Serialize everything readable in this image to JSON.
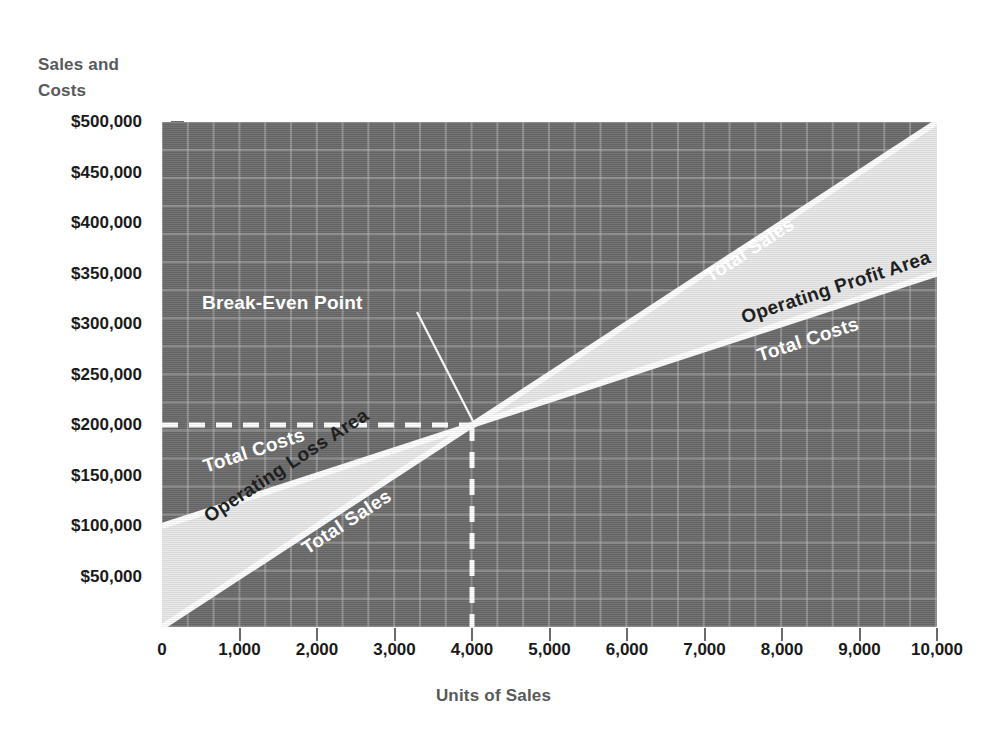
{
  "chart_data": {
    "type": "line",
    "title": "",
    "xlabel": "Units of Sales",
    "ylabel_line1": "Sales and",
    "ylabel_line2": "Costs",
    "xlim": [
      0,
      10000
    ],
    "ylim": [
      0,
      500000
    ],
    "grid": true,
    "legend_position": "inline-labels",
    "x_ticks": [
      0,
      1000,
      2000,
      3000,
      4000,
      5000,
      6000,
      7000,
      8000,
      9000,
      10000
    ],
    "x_tick_labels": [
      "0",
      "1,000",
      "2,000",
      "3,000",
      "4,000",
      "5,000",
      "6,000",
      "7,000",
      "8,000",
      "9,000",
      "10,000"
    ],
    "y_ticks": [
      50000,
      100000,
      150000,
      200000,
      250000,
      300000,
      350000,
      400000,
      450000,
      500000
    ],
    "y_tick_labels": [
      "$50,000",
      "$100,000",
      "$150,000",
      "$200,000",
      "$250,000",
      "$300,000",
      "$350,000",
      "$400,000",
      "$450,000",
      "$500,000"
    ],
    "series": [
      {
        "name": "Total Sales",
        "x": [
          0,
          10000
        ],
        "values": [
          0,
          500000
        ],
        "color": "#ffffff"
      },
      {
        "name": "Total Costs",
        "x": [
          0,
          10000
        ],
        "values": [
          100000,
          350000
        ],
        "color": "#ffffff"
      }
    ],
    "annotations": [
      {
        "name": "break-even-point",
        "text": "Break-Even Point",
        "x": 4000,
        "y": 200000
      },
      {
        "name": "operating-profit-area",
        "text": "Operating Profit Area"
      },
      {
        "name": "operating-loss-area",
        "text": "Operating Loss Area"
      }
    ],
    "break_even": {
      "units": 4000,
      "amount": 200000
    }
  },
  "labels": {
    "y_axis_title_line1": "Sales and",
    "y_axis_title_line2": "Costs",
    "x_axis_title": "Units of Sales",
    "total_sales_upper": "Total Sales",
    "total_sales_lower": "Total Sales",
    "total_costs_upper": "Total Costs",
    "total_costs_lower": "Total Costs",
    "operating_profit_area": "Operating Profit Area",
    "operating_loss_area": "Operating Loss Area",
    "break_even_point": "Break-Even Point"
  },
  "colors": {
    "plot_background": "#6c6c6c",
    "gridline": "#bebebe",
    "band_fill": "#e9e9e9",
    "line": "#ffffff",
    "axis_text": "#1a1a1a",
    "axis_title": "#58595b",
    "page_background": "#ffffff"
  }
}
